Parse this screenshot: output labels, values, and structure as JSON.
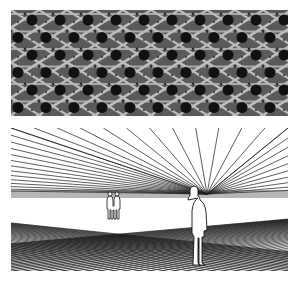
{
  "figure": {
    "panels": [
      {
        "id": "texture",
        "description": "Photograph of woven cane texture with regular hexagonal holes",
        "colors": {
          "background": "#5a5a5a",
          "strand": "#c9c9c9",
          "strand_shadow": "#3a3a3a",
          "hole": "#111111"
        },
        "grid": {
          "columns": 10,
          "rows": 6,
          "cell_w": 28,
          "cell_h": 17.5
        }
      },
      {
        "id": "perspective",
        "description": "Line drawing of a perspective grid with a vanishing point and two human figures",
        "colors": {
          "line": "#1a1a1a",
          "figure_fill": "#ffffff",
          "figure_stroke": "#111111"
        },
        "vanishing_point": {
          "x": 196,
          "y": 66
        },
        "horizon_y": 68,
        "figures": [
          {
            "id": "distant-pair",
            "x": 100,
            "y": 64,
            "scale": 0.42
          },
          {
            "id": "near-person",
            "x": 183,
            "y": 60,
            "scale": 1.0
          }
        ]
      }
    ]
  }
}
